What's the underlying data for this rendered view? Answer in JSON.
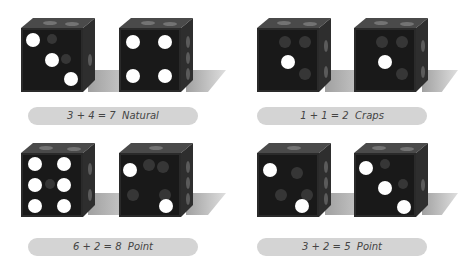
{
  "rolls": [
    {
      "label": "3 + 4 = 7  Natural",
      "dice": [
        3,
        4
      ],
      "sum": 7,
      "result": "Natural"
    },
    {
      "label": "1 + 1 = 2  Craps",
      "dice": [
        1,
        1
      ],
      "sum": 2,
      "result": "Craps"
    },
    {
      "label": "6 + 2 = 8  Point",
      "dice": [
        6,
        2
      ],
      "sum": 8,
      "result": "Point"
    },
    {
      "label": "3 + 2 = 5  Point",
      "dice": [
        3,
        2
      ],
      "sum": 5,
      "result": "Point"
    }
  ],
  "colors": {
    "die_front": "#191919",
    "pip": "#ffffff",
    "pill_bg": "#d4d4d4",
    "label_text": "#444444"
  }
}
